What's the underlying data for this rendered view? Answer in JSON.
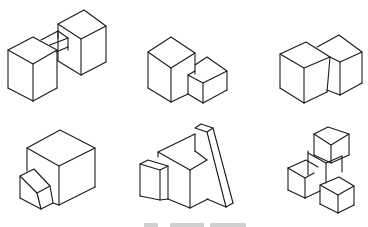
{
  "figure": {
    "stroke_color": "#1a1a1a",
    "background_color": "#ffffff",
    "panels": [
      {
        "id": "panel-1",
        "label": "two cubes joined by a rectangular connecting bar"
      },
      {
        "id": "panel-2",
        "label": "large cube with smaller box adjoining its right face"
      },
      {
        "id": "panel-3",
        "label": "two equal cubes overlapping side by side"
      },
      {
        "id": "panel-4",
        "label": "large cube with small box in front-left corner"
      },
      {
        "id": "panel-5",
        "label": "cube with small box on left and tall slanted bar leaning on right"
      },
      {
        "id": "panel-6",
        "label": "stack of four cubes in stepped arrangement"
      }
    ],
    "caption": {
      "text": "",
      "note": "caption clipped at bottom edge; illegible"
    }
  }
}
